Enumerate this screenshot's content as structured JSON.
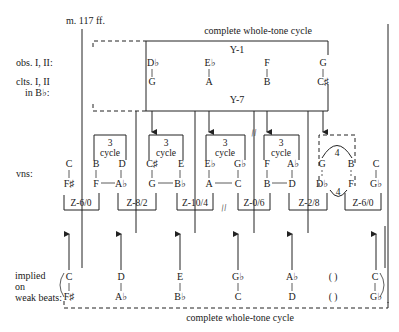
{
  "header": {
    "measure": "m. 117 ff.",
    "top_caption": "complete whole-tone cycle",
    "bottom_caption": "complete whole-tone cycle"
  },
  "row_labels": {
    "obs": "obs. I, II:",
    "clts_1": "clts. I, II",
    "clts_2": "in B♭:",
    "vns": "vns:",
    "implied_1": "implied",
    "implied_2": "on",
    "implied_3": "weak beats:"
  },
  "y_cycles": {
    "y1": "Y-1",
    "y7": "Y-7",
    "dyads": [
      {
        "top": "D♭",
        "bottom": "G"
      },
      {
        "top": "E♭",
        "bottom": "A"
      },
      {
        "top": "F",
        "bottom": "B"
      },
      {
        "top": "G",
        "bottom": "C♯"
      }
    ]
  },
  "violins": {
    "cycle_box_num": "3",
    "cycle_box_word": "cycle",
    "four_label": "4",
    "groups": [
      {
        "z_label": "Z-6/0",
        "dyads": [
          {
            "top": "C",
            "bottom": "F♯"
          }
        ]
      },
      {
        "z_label": "Z-8/2",
        "dyads": [
          {
            "top": "B",
            "bottom": "F"
          },
          {
            "top": "D",
            "bottom": "A♭"
          }
        ]
      },
      {
        "z_label": "Z-10/4",
        "dyads": [
          {
            "top": "C♯",
            "bottom": "G"
          },
          {
            "top": "E",
            "bottom": "B♭"
          }
        ]
      },
      {
        "z_label": "Z-0/6",
        "dyads": [
          {
            "top": "E♭",
            "bottom": "A"
          },
          {
            "top": "G♭",
            "bottom": "C"
          }
        ]
      },
      {
        "z_label": "Z-2/8",
        "dyads": [
          {
            "top": "F",
            "bottom": "B"
          },
          {
            "top": "A♭",
            "bottom": "D"
          }
        ]
      },
      {
        "z_label": "Z-6/0",
        "dyads": [
          {
            "top": "G",
            "bottom": "D♭"
          },
          {
            "top": "B",
            "bottom": "F"
          },
          {
            "top": "C",
            "bottom": "G♭"
          }
        ]
      }
    ]
  },
  "implied": {
    "dyads": [
      {
        "top": "C",
        "bottom": "F♯"
      },
      {
        "top": "D",
        "bottom": "A♭"
      },
      {
        "top": "E",
        "bottom": "B♭"
      },
      {
        "top": "G♭",
        "bottom": "C"
      },
      {
        "top": "A♭",
        "bottom": "D"
      },
      {
        "top": "( )",
        "bottom": "( )"
      },
      {
        "top": "C",
        "bottom": "G♭"
      }
    ]
  },
  "symbols": {
    "break_mark": "//"
  }
}
